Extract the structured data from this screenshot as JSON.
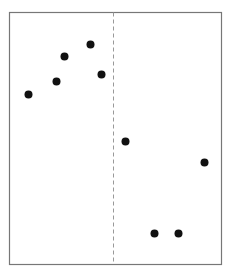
{
  "chart_data": {
    "type": "scatter",
    "title": "",
    "xlabel": "",
    "ylabel": "",
    "grid": false,
    "legend": null,
    "xlim": [
      0,
      212
    ],
    "ylim": [
      0,
      252
    ],
    "points": [
      {
        "x": 19,
        "y": 170
      },
      {
        "x": 47,
        "y": 183
      },
      {
        "x": 55,
        "y": 208
      },
      {
        "x": 81,
        "y": 220
      },
      {
        "x": 92,
        "y": 190
      },
      {
        "x": 116,
        "y": 123
      },
      {
        "x": 195,
        "y": 102
      },
      {
        "x": 145,
        "y": 31
      },
      {
        "x": 169,
        "y": 31
      }
    ],
    "reference_line": {
      "orientation": "vertical",
      "x": 104,
      "style": "dashed"
    },
    "colors": {
      "points": "#111111",
      "frame": "#777777",
      "reference_line": "#999999"
    }
  }
}
